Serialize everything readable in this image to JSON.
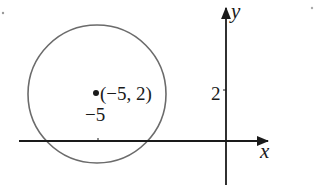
{
  "diagram": {
    "type": "coordinate-plane-circle",
    "axes": {
      "x_label": "x",
      "y_label": "y"
    },
    "circle": {
      "center_label": "(−5, 2)",
      "center": [
        -5,
        2
      ]
    },
    "ticks": {
      "x_tick_label": "−5",
      "y_tick_label": "2"
    },
    "colors": {
      "axis": "#1a1a1a",
      "circle": "#6b6b6b",
      "text": "#1a1a1a"
    }
  }
}
